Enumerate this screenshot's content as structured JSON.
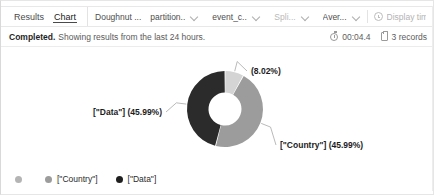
{
  "toolbar": {
    "tabs": [
      {
        "label": "Results",
        "active": false
      },
      {
        "label": "Chart",
        "active": true
      }
    ],
    "controls": [
      {
        "name": "chart-type",
        "label": "Doughnut ...",
        "chevron": false,
        "muted": false
      },
      {
        "name": "partition-field",
        "label": "partition...",
        "chevron": true,
        "muted": false
      },
      {
        "name": "event-column",
        "label": "event_c...",
        "chevron": true,
        "muted": false
      },
      {
        "name": "split-series",
        "label": "Spli...",
        "chevron": true,
        "muted": true
      },
      {
        "name": "aggregation",
        "label": "Aver...",
        "chevron": true,
        "muted": false
      }
    ],
    "display_time": {
      "label": "Display time (UTC+",
      "icon": "clock-icon"
    }
  },
  "status": {
    "state": "Completed.",
    "message": "Showing results from the last 24 hours.",
    "duration": "00:04.4",
    "duration_icon": "timer-icon",
    "records": "3 records",
    "records_icon": "records-icon"
  },
  "chart_data": {
    "type": "pie",
    "variant": "doughnut",
    "title": "",
    "categories": [
      "",
      "[\"Country\"]",
      "[\"Data\"]"
    ],
    "values": [
      8.02,
      45.99,
      45.99
    ],
    "value_unit": "%",
    "colors": [
      "#d4d4d4",
      "#9c9c9c",
      "#2b2b2b"
    ],
    "legend_position": "bottom",
    "grid": false,
    "labels": [
      {
        "name": "slice-label-other",
        "text": "(8.02%)",
        "value": 8.02
      },
      {
        "name": "slice-label-data",
        "text": "[\"Data\"] (45.99%)",
        "value": 45.99
      },
      {
        "name": "slice-label-country",
        "text": "[\"Country\"] (45.99%)",
        "value": 45.99
      }
    ],
    "legend": [
      {
        "label": "",
        "color": "#b4b4b4"
      },
      {
        "label": "[\"Country\"]",
        "color": "#9c9c9c"
      },
      {
        "label": "[\"Data\"]",
        "color": "#1f1f1f"
      }
    ]
  }
}
